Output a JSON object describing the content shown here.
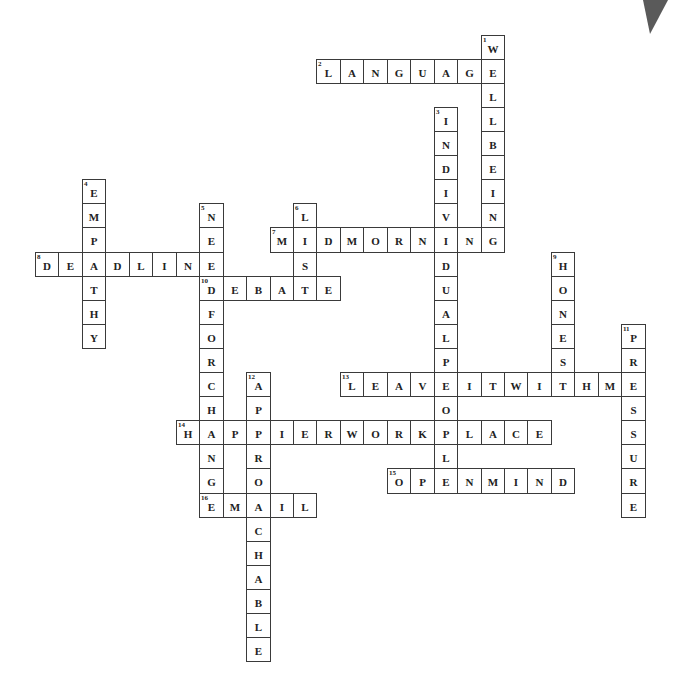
{
  "puzzle": {
    "grid": {
      "origin_x": 35,
      "origin_y": 251.5,
      "cell_w": 23.45,
      "cell_h": 24.1
    },
    "colors": {
      "border": "#3a3a3a",
      "text": "#222222",
      "background": "#ffffff",
      "corner_mark": "#5a5a5a"
    },
    "words": [
      {
        "number": 1,
        "direction": "down",
        "answer": "WELLBEING",
        "col": 19,
        "row": -9
      },
      {
        "number": 2,
        "direction": "across",
        "answer": "LANGUAGE",
        "col": 12,
        "row": -8
      },
      {
        "number": 3,
        "direction": "down",
        "answer": "INDIVIDUALPEOPLE",
        "col": 17,
        "row": -6
      },
      {
        "number": 4,
        "direction": "down",
        "answer": "EMPATHY",
        "col": 2,
        "row": -3
      },
      {
        "number": 5,
        "direction": "down",
        "answer": "NEEDFORCHANGE",
        "col": 7,
        "row": -2
      },
      {
        "number": 6,
        "direction": "down",
        "answer": "LIST",
        "col": 11,
        "row": -2
      },
      {
        "number": 7,
        "direction": "across",
        "answer": "MIDMORNING",
        "col": 10,
        "row": -1
      },
      {
        "number": 8,
        "direction": "across",
        "answer": "DEADLINE",
        "col": 0,
        "row": 0
      },
      {
        "number": 9,
        "direction": "down",
        "answer": "HONEST",
        "col": 22,
        "row": 0
      },
      {
        "number": 10,
        "direction": "across",
        "answer": "DEBATE",
        "col": 7,
        "row": 1
      },
      {
        "number": 11,
        "direction": "down",
        "answer": "PRESSURE",
        "col": 25,
        "row": 3
      },
      {
        "number": 12,
        "direction": "down",
        "answer": "APPROACHABLE",
        "col": 9,
        "row": 5
      },
      {
        "number": 13,
        "direction": "across",
        "answer": "LEAVEITWITHME",
        "col": 13,
        "row": 5
      },
      {
        "number": 14,
        "direction": "across",
        "answer": "HAPPIERWORKPLACE",
        "col": 6,
        "row": 7
      },
      {
        "number": 15,
        "direction": "across",
        "answer": "OPENMIND",
        "col": 15,
        "row": 9
      },
      {
        "number": 16,
        "direction": "across",
        "answer": "EMAIL",
        "col": 7,
        "row": 10
      }
    ]
  },
  "corner_mark": {
    "shape": "triangle",
    "points": "643,0 668,0 650,34"
  }
}
